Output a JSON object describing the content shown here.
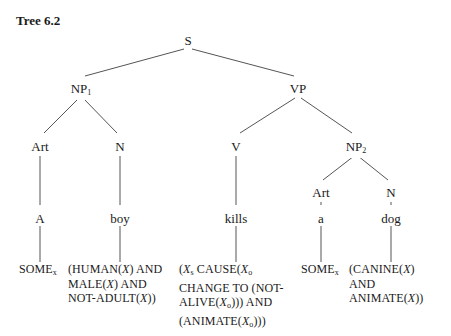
{
  "title": "Tree 6.2",
  "tree": {
    "root": {
      "label": "S"
    },
    "np1": {
      "label": "NP",
      "sub": "1"
    },
    "vp": {
      "label": "VP"
    },
    "art1": {
      "label": "Art"
    },
    "n1": {
      "label": "N"
    },
    "v": {
      "label": "V"
    },
    "np2": {
      "label": "NP",
      "sub": "2"
    },
    "art2": {
      "label": "Art"
    },
    "n2": {
      "label": "N"
    }
  },
  "words": {
    "w1": "A",
    "w2": "boy",
    "w3": "kills",
    "w4": "a",
    "w5": "dog"
  },
  "formulas": {
    "f1": {
      "main": "SOME",
      "sub": "x"
    },
    "f2": {
      "line1a": "(HUMAN(",
      "line1x": "X",
      "line1b": ") AND",
      "line2a": "MALE(",
      "line2x": "X",
      "line2b": ") AND",
      "line3a": "NOT-ADULT(",
      "line3x": "X",
      "line3b": "))"
    },
    "f3": {
      "line1a": "(",
      "line1x": "X",
      "line1s": "s",
      "line1b": " CAUSE(",
      "line1x2": "X",
      "line1s2": "o",
      "line2": "CHANGE TO (NOT-",
      "line3a": "ALIVE(",
      "line3x": "X",
      "line3s": "o",
      "line3b": "))) AND",
      "line4a": "(ANIMATE(",
      "line4x": "X",
      "line4s": "o",
      "line4b": ")))"
    },
    "f4": {
      "main": "SOME",
      "sub": "x"
    },
    "f5": {
      "line1a": "(CANINE(",
      "line1x": "X",
      "line1b": ")",
      "line2": "AND",
      "line3a": "ANIMATE(",
      "line3x": "X",
      "line3b": "))"
    }
  }
}
